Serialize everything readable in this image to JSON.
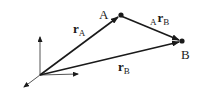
{
  "diagram": {
    "points": {
      "origin": {
        "x": 40,
        "y": 75
      },
      "A": {
        "x": 120,
        "y": 15,
        "label": "A"
      },
      "B": {
        "x": 182,
        "y": 41,
        "label": "B"
      }
    },
    "vectors": [
      {
        "id": "r_A",
        "main": "r",
        "sub": "A",
        "pre": ""
      },
      {
        "id": "r_B",
        "main": "r",
        "sub": "B",
        "pre": ""
      },
      {
        "id": "A_r_B",
        "main": "r",
        "sub": "B",
        "pre": "A"
      }
    ],
    "color": "#1a1a1a"
  }
}
